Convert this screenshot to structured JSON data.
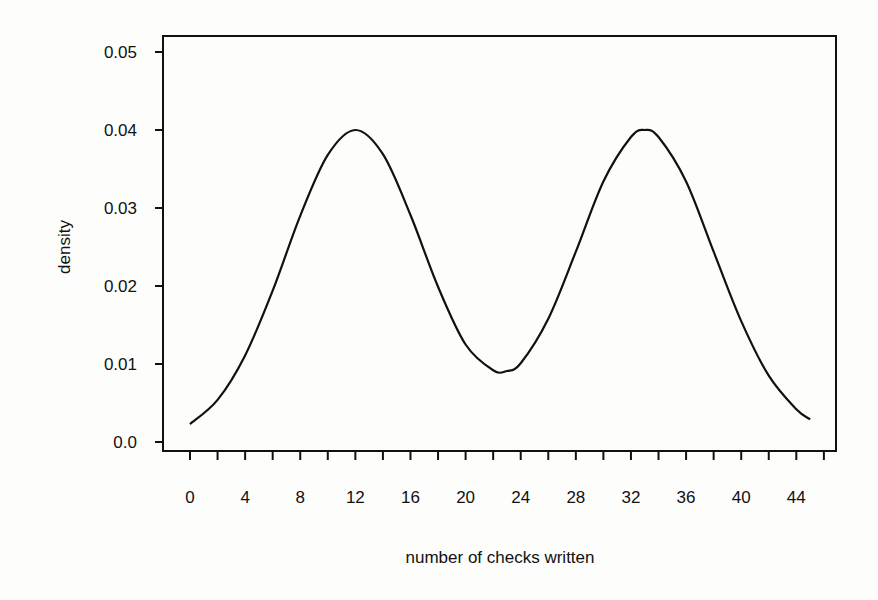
{
  "chart_data": {
    "type": "line",
    "title": "",
    "xlabel": "number of checks written",
    "ylabel": "density",
    "xlim": [
      0,
      46
    ],
    "ylim": [
      0.0,
      0.05
    ],
    "grid": false,
    "legend": null,
    "x_ticks": [
      0,
      4,
      8,
      12,
      16,
      20,
      24,
      28,
      32,
      36,
      40,
      44
    ],
    "x_minor_ticks_step": 2,
    "y_ticks": [
      "0.0",
      "0.01",
      "0.02",
      "0.03",
      "0.04",
      "0.05"
    ],
    "series": [
      {
        "name": "density",
        "x": [
          0,
          2,
          4,
          6,
          8,
          10,
          12,
          14,
          16,
          18,
          20,
          22,
          23,
          24,
          26,
          28,
          30,
          32,
          33,
          34,
          36,
          38,
          40,
          42,
          44,
          45
        ],
        "values": [
          0.0023,
          0.0054,
          0.0111,
          0.0194,
          0.029,
          0.0368,
          0.04,
          0.0369,
          0.0291,
          0.0199,
          0.0125,
          0.0092,
          0.0091,
          0.0101,
          0.0158,
          0.0244,
          0.0334,
          0.0391,
          0.04,
          0.0391,
          0.0334,
          0.0244,
          0.0155,
          0.0085,
          0.0042,
          0.0029
        ]
      }
    ],
    "annotations": []
  }
}
